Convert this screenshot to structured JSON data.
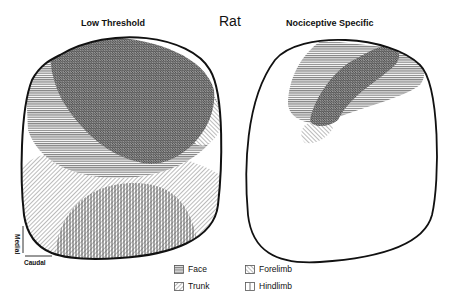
{
  "figure": {
    "main_title": "Rat",
    "panels": [
      {
        "title": "Low Threshold"
      },
      {
        "title": "Nociceptive Specific"
      }
    ],
    "orientation": {
      "vertical_axis_label": "Medial",
      "horizontal_axis_label": "Caudal"
    },
    "legend": [
      {
        "label": "Face",
        "pattern": "horizontal-lines"
      },
      {
        "label": "Trunk",
        "pattern": "back-diagonal-lines"
      },
      {
        "label": "Forelimb",
        "pattern": "forward-diagonal-lines"
      },
      {
        "label": "Hindlimb",
        "pattern": "vertical-lines"
      }
    ],
    "colors": {
      "outline": "#111111",
      "hatch": "#555555"
    }
  }
}
